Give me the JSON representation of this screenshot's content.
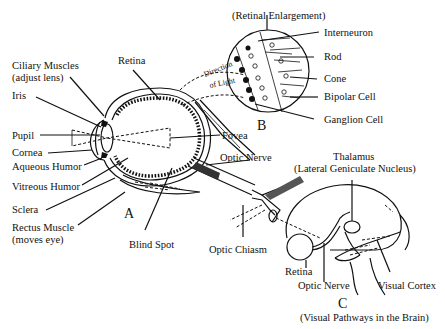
{
  "diagram": {
    "panels": {
      "A": {
        "letter": "A",
        "description": "Cross-section of the eye",
        "labels": {
          "ciliary_muscles": "Ciliary Muscles",
          "ciliary_muscles_note": "(adjust lens)",
          "iris": "Iris",
          "pupil": "Pupil",
          "cornea": "Cornea",
          "aqueous_humor": "Aqueous Humor",
          "vitreous_humor": "Vitreous Humor",
          "sclera": "Sclera",
          "rectus_muscle": "Rectus Muscle",
          "rectus_muscle_note": "(moves eye)",
          "retina": "Retina",
          "fovea": "Fovea",
          "optic_nerve": "Optic Nerve",
          "blind_spot": "Blind Spot",
          "optic_chiasm": "Optic Chiasm",
          "direction_of_light_1": "Direction",
          "direction_of_light_2": "of Light"
        }
      },
      "B": {
        "letter": "B",
        "title": "(Retinal Enlargement)",
        "labels": {
          "interneuron": "Interneuron",
          "rod": "Rod",
          "cone": "Cone",
          "bipolar_cell": "Bipolar Cell",
          "ganglion_cell": "Ganglion Cell"
        }
      },
      "C": {
        "letter": "C",
        "caption": "(Visual Pathways in the Brain)",
        "labels": {
          "thalamus": "Thalamus",
          "thalamus_note": "(Lateral Geniculate Nucleus)",
          "retina": "Retina",
          "optic_nerve": "Optic Nerve",
          "visual_cortex": "Visual Cortex"
        }
      }
    },
    "colors": {
      "ink": "#111111",
      "background": "#ffffff"
    }
  }
}
